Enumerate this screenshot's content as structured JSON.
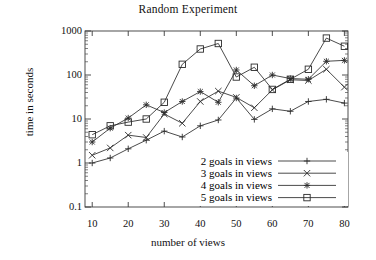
{
  "chart_data": {
    "type": "line",
    "title": "Random Experiment",
    "xlabel": "number of views",
    "ylabel": "time in seconds",
    "xlim": [
      8,
      81
    ],
    "ylim": [
      0.1,
      1000
    ],
    "yscale": "log",
    "grid": false,
    "legend_position": "inside-lower-right",
    "xticks": [
      10,
      20,
      30,
      40,
      50,
      60,
      70,
      80
    ],
    "yticks": [
      0.1,
      1,
      10,
      100,
      1000
    ],
    "ytick_labels": [
      "0.1",
      "1",
      "10",
      "100",
      "1000"
    ],
    "x": [
      10,
      15,
      20,
      25,
      30,
      35,
      40,
      45,
      50,
      55,
      60,
      65,
      70,
      75,
      80
    ],
    "series": [
      {
        "name": "2 goals in views",
        "marker": "plus",
        "values": [
          1.0,
          1.3,
          2.1,
          3.3,
          5.3,
          3.9,
          7.0,
          9.5,
          30,
          9.8,
          17,
          15,
          25,
          28,
          23
        ]
      },
      {
        "name": "3 goals in views",
        "marker": "cross",
        "values": [
          1.5,
          2.2,
          4.3,
          3.8,
          13,
          8.0,
          25,
          43,
          31,
          18,
          46,
          78,
          75,
          135,
          53
        ]
      },
      {
        "name": "4 goals in views",
        "marker": "star",
        "values": [
          3.0,
          6.2,
          10.5,
          21,
          14,
          25,
          42,
          24,
          130,
          57,
          100,
          83,
          80,
          205,
          215
        ]
      },
      {
        "name": "5 goals in views",
        "marker": "square",
        "values": [
          4.4,
          7.0,
          8.5,
          10.0,
          24,
          175,
          390,
          520,
          90,
          150,
          47,
          80,
          135,
          690,
          450
        ]
      }
    ]
  }
}
